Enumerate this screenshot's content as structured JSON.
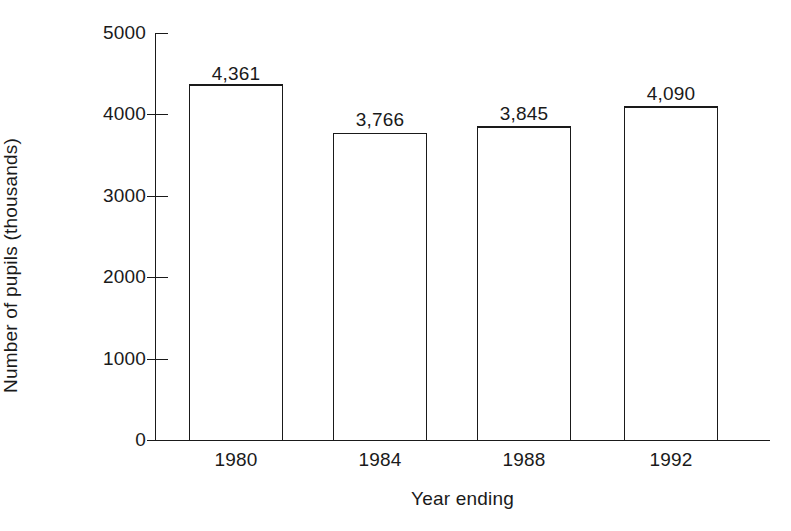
{
  "chart_data": {
    "type": "bar",
    "title": "",
    "subtitle": "",
    "xlabel": "Year ending",
    "ylabel": "Number of pupils (thousands)",
    "categories": [
      "1980",
      "1984",
      "1988",
      "1992"
    ],
    "values": [
      4361,
      3766,
      3845,
      4090
    ],
    "value_labels": [
      "4,361",
      "3,766",
      "3,845",
      "4,090"
    ],
    "ylim": [
      0,
      5000
    ],
    "ytick_values": [
      0,
      1000,
      2000,
      3000,
      4000,
      5000
    ],
    "ytick_labels": [
      "0",
      "1000",
      "2000",
      "3000",
      "4000",
      "5000"
    ],
    "grid": false,
    "legend": false,
    "legend_position": "none",
    "bar_fill": "#ffffff",
    "bar_stroke": "#1a1a1a",
    "background": "#ffffff",
    "annotations": []
  },
  "axes": {
    "x_title": "Year ending",
    "y_title": "Number of pupils (thousands)"
  }
}
